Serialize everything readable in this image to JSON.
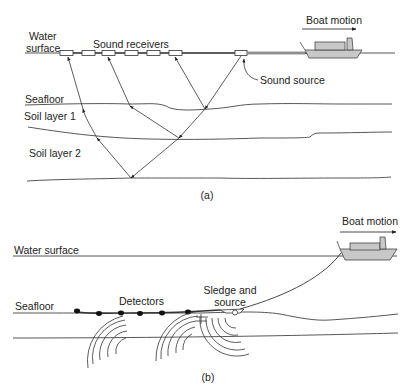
{
  "panel_a": {
    "label": "(a)",
    "boat_motion": "Boat motion",
    "water_surface_line1": "Water",
    "water_surface_line2": "surface",
    "sound_receivers": "Sound receivers",
    "sound_source": "Sound source",
    "seafloor": "Seafloor",
    "soil_layer_1": "Soil layer 1",
    "soil_layer_2": "Soil layer 2",
    "receiver_count": 6
  },
  "panel_b": {
    "label": "(b)",
    "boat_motion": "Boat motion",
    "water_surface": "Water surface",
    "seafloor": "Seafloor",
    "detectors": "Detectors",
    "sledge_line1": "Sledge and",
    "sledge_line2": "source",
    "detector_count": 6
  },
  "colors": {
    "line": "#333333",
    "boat_fill": "#c8c8c8",
    "background": "#ffffff"
  }
}
